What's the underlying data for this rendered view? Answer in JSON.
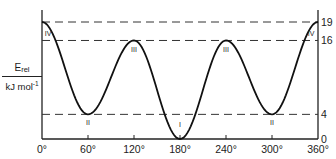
{
  "chart_data": {
    "type": "line",
    "title": "",
    "xlabel": "",
    "ylabel": "E_rel / kJ mol^-1",
    "ylabel_parts": {
      "main": "E",
      "sub": "rel",
      "unit": "kJ mol",
      "unit_sup": "-1"
    },
    "xlim": [
      0,
      360
    ],
    "ylim": [
      0,
      19
    ],
    "grid": false,
    "x_ticks": [
      0,
      60,
      120,
      180,
      240,
      300,
      360
    ],
    "x_tick_labels": [
      "0°",
      "60°",
      "120°",
      "180°",
      "240°",
      "300°",
      "360°"
    ],
    "right_y_ticks": [
      0,
      4,
      16,
      19
    ],
    "right_y_tick_labels": [
      "0",
      "4",
      "16",
      "19"
    ],
    "reference_lines": [
      {
        "y": 19,
        "style": "dashed"
      },
      {
        "y": 16,
        "style": "dashed"
      },
      {
        "y": 4,
        "style": "dashed"
      }
    ],
    "series": [
      {
        "name": "Energy profile",
        "x": [
          0,
          60,
          120,
          180,
          240,
          300,
          360
        ],
        "y": [
          19,
          4,
          16,
          0,
          16,
          4,
          19
        ]
      }
    ],
    "annotations": [
      {
        "label": "IV",
        "x": 0,
        "y": 19,
        "note": "left, below curve start"
      },
      {
        "label": "II",
        "x": 60,
        "y": 4
      },
      {
        "label": "III",
        "x": 120,
        "y": 16
      },
      {
        "label": "I",
        "x": 180,
        "y": 0
      },
      {
        "label": "III",
        "x": 240,
        "y": 16
      },
      {
        "label": "II",
        "x": 300,
        "y": 4
      },
      {
        "label": "IV",
        "x": 360,
        "y": 19
      }
    ]
  },
  "colors": {
    "line": "#111111",
    "dash": "#333333",
    "axis": "#222222"
  }
}
